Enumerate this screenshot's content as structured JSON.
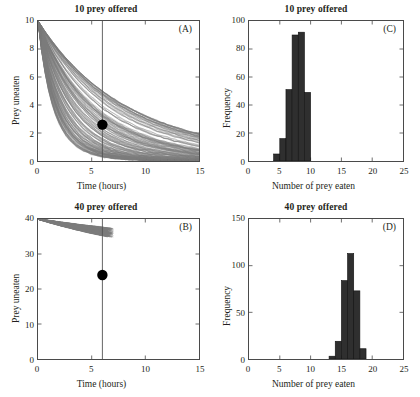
{
  "figure": {
    "panels": [
      "A",
      "C",
      "B",
      "D"
    ]
  },
  "panel_a": {
    "title": "10 prey offered",
    "letter": "(A)",
    "xlabel": "Time (hours)",
    "ylabel": "Prey uneaten",
    "xticks": [
      "0",
      "5",
      "10",
      "15"
    ],
    "yticks": [
      "0",
      "2",
      "4",
      "6",
      "8",
      "10"
    ]
  },
  "panel_b": {
    "title": "40 prey offered",
    "letter": "(B)",
    "xlabel": "Time (hours)",
    "ylabel": "Prey uneaten",
    "xticks": [
      "0",
      "5",
      "10",
      "15"
    ],
    "yticks": [
      "0",
      "10",
      "20",
      "30",
      "40"
    ]
  },
  "panel_c": {
    "title": "10 prey offered",
    "letter": "(C)",
    "xlabel": "Number of prey eaten",
    "ylabel": "Frequency",
    "xticks": [
      "0",
      "5",
      "10",
      "15",
      "20",
      "25"
    ],
    "yticks": [
      "0",
      "20",
      "40",
      "60",
      "80",
      "100"
    ]
  },
  "panel_d": {
    "title": "40 prey offered",
    "letter": "(D)",
    "xlabel": "Number of prey eaten",
    "ylabel": "Frequency",
    "xticks": [
      "0",
      "5",
      "10",
      "15",
      "20",
      "25"
    ],
    "yticks": [
      "0",
      "50",
      "100",
      "150"
    ]
  },
  "chart_data": [
    {
      "id": "panel-a",
      "type": "line",
      "title": "10 prey offered",
      "panel_label": "(A)",
      "xlabel": "Time (hours)",
      "ylabel": "Prey uneaten",
      "xlim": [
        0,
        15
      ],
      "ylim": [
        0,
        10
      ],
      "xticks": [
        0,
        5,
        10,
        15
      ],
      "yticks": [
        0,
        2,
        4,
        6,
        8,
        10
      ],
      "grid": false,
      "legend": "none",
      "description": "Dense bundle of ~200 simulated depletion trajectories all starting at 10 prey uneaten at time 0 and decaying toward 0; a vertical reference line at t = 6 hours and a filled black marker showing the mean prey uneaten at t = 6.",
      "reference_line_x": 6,
      "mean_marker": {
        "x": 6,
        "y": 2.6
      },
      "n_trajectories": 200,
      "start_value": 10,
      "representative_trajectories": [
        {
          "name": "fast-depletion",
          "x": [
            0,
            1,
            2,
            3,
            4,
            5,
            6,
            8,
            10,
            12,
            15
          ],
          "y": [
            10,
            7.4,
            4.9,
            3.0,
            1.6,
            0.7,
            0.2,
            0.0,
            0.0,
            0.0,
            0.0
          ]
        },
        {
          "name": "upper-quartile",
          "x": [
            0,
            1,
            2,
            3,
            4,
            5,
            6,
            8,
            10,
            12,
            15
          ],
          "y": [
            10,
            9.0,
            7.9,
            6.8,
            5.9,
            5.1,
            4.4,
            3.4,
            2.7,
            2.2,
            1.6
          ]
        },
        {
          "name": "median",
          "x": [
            0,
            1,
            2,
            3,
            4,
            5,
            6,
            8,
            10,
            12,
            15
          ],
          "y": [
            10,
            8.5,
            7.0,
            5.6,
            4.3,
            3.4,
            2.6,
            1.6,
            1.0,
            0.6,
            0.3
          ]
        },
        {
          "name": "lower-quartile",
          "x": [
            0,
            1,
            2,
            3,
            4,
            5,
            6,
            8,
            10,
            12,
            15
          ],
          "y": [
            10,
            8.0,
            6.1,
            4.4,
            3.0,
            1.9,
            1.2,
            0.5,
            0.2,
            0.1,
            0.0
          ]
        },
        {
          "name": "slow-depletion",
          "x": [
            0,
            1,
            2,
            3,
            4,
            5,
            6,
            8,
            10,
            12,
            15
          ],
          "y": [
            10,
            9.4,
            8.7,
            8.0,
            7.3,
            6.7,
            6.1,
            5.1,
            4.3,
            3.7,
            3.0
          ]
        }
      ]
    },
    {
      "id": "panel-b",
      "type": "line",
      "title": "40 prey offered",
      "panel_label": "(B)",
      "xlabel": "Time (hours)",
      "ylabel": "Prey uneaten",
      "xlim": [
        0,
        15
      ],
      "ylim": [
        0,
        40
      ],
      "xticks": [
        0,
        5,
        10,
        15
      ],
      "yticks": [
        0,
        10,
        20,
        30,
        40
      ],
      "grid": false,
      "legend": "none",
      "description": "Narrow fan of ~200 simulated depletion trajectories starting at 40 prey uneaten at time 0, declining nearly linearly to roughly 20-25 prey uneaten by t = 6 hours where the simulation ends; vertical reference line at t = 6 and a filled black mean marker at about 24 prey uneaten.",
      "reference_line_x": 6,
      "mean_marker": {
        "x": 6,
        "y": 24
      },
      "n_trajectories": 200,
      "start_value": 40,
      "representative_trajectories": [
        {
          "name": "fast-depletion",
          "x": [
            0,
            1,
            2,
            3,
            4,
            5,
            6,
            6.6
          ],
          "y": [
            40,
            36.5,
            33.2,
            30.0,
            26.9,
            23.6,
            20.4,
            20.2
          ]
        },
        {
          "name": "upper-quartile",
          "x": [
            0,
            1,
            2,
            3,
            4,
            5,
            6,
            6.8
          ],
          "y": [
            40,
            38.1,
            36.2,
            34.2,
            32.2,
            30.1,
            26.0,
            25.8
          ]
        },
        {
          "name": "median",
          "x": [
            0,
            1,
            2,
            3,
            4,
            5,
            6,
            6.7
          ],
          "y": [
            40,
            37.4,
            34.8,
            32.1,
            29.5,
            26.8,
            24.0,
            23.7
          ]
        },
        {
          "name": "lower-quartile",
          "x": [
            0,
            1,
            2,
            3,
            4,
            5,
            6,
            6.5
          ],
          "y": [
            40,
            36.9,
            33.8,
            30.9,
            28.0,
            25.0,
            22.1,
            21.9
          ]
        },
        {
          "name": "slow-depletion",
          "x": [
            0,
            1,
            2,
            3,
            4,
            5,
            6,
            7.0
          ],
          "y": [
            40,
            38.6,
            37.2,
            35.7,
            34.1,
            32.4,
            27.2,
            27.0
          ]
        }
      ]
    },
    {
      "id": "panel-c",
      "type": "bar",
      "title": "10 prey offered",
      "panel_label": "(C)",
      "xlabel": "Number of prey eaten",
      "ylabel": "Frequency",
      "xlim": [
        0,
        25
      ],
      "ylim": [
        0,
        100
      ],
      "xticks": [
        0,
        5,
        10,
        15,
        20,
        25
      ],
      "yticks": [
        0,
        20,
        40,
        60,
        80,
        100
      ],
      "grid": false,
      "legend": "none",
      "bin_width": 1,
      "bin_starts": [
        4,
        5,
        6,
        7,
        8,
        9
      ],
      "categories": [
        "4",
        "5",
        "6",
        "7",
        "8",
        "9"
      ],
      "values": [
        5,
        16,
        51,
        90,
        92,
        49
      ],
      "description": "Histogram of the number of prey eaten after 6 hours when 10 prey were offered; distribution spans 4 to 10 prey eaten with a peak near 8."
    },
    {
      "id": "panel-d",
      "type": "bar",
      "title": "40 prey offered",
      "panel_label": "(D)",
      "xlabel": "Number of prey eaten",
      "ylabel": "Frequency",
      "xlim": [
        0,
        25
      ],
      "ylim": [
        0,
        150
      ],
      "xticks": [
        0,
        5,
        10,
        15,
        20,
        25
      ],
      "yticks": [
        0,
        50,
        100,
        150
      ],
      "grid": false,
      "legend": "none",
      "bin_width": 1,
      "bin_starts": [
        13,
        14,
        15,
        16,
        17,
        18
      ],
      "categories": [
        "13",
        "14",
        "15",
        "16",
        "17",
        "18"
      ],
      "values": [
        3,
        19,
        84,
        113,
        73,
        11
      ],
      "description": "Histogram of the number of prey eaten after 6 hours when 40 prey were offered; distribution spans 13 to 19 prey eaten with a peak near 16-17."
    }
  ],
  "colors": {
    "bar_fill": "#2f2f2f",
    "trajectory": "#7a7a7a",
    "axis": "#4a4a4a",
    "marker": "#000000",
    "reference_line": "#555555",
    "text": "#231f20"
  }
}
